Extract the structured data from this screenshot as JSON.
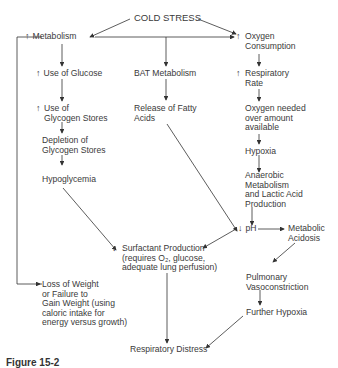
{
  "diagram": {
    "nodes": {
      "cold_stress": "COLD STRESS",
      "metabolism": "Metabolism",
      "oxygen_consumption": "Oxygen\nConsumption",
      "use_of_glucose": "Use of Glucose",
      "bat_metabolism": "BAT Metabolism",
      "respiratory_rate": "Respiratory\nRate",
      "use_of_glycogen": "Use of\nGlycogen Stores",
      "release_fatty_acids": "Release of Fatty\nAcids",
      "oxygen_needed": "Oxygen needed\nover amount\navailable",
      "depletion_glycogen": "Depletion of\nGlycogen Stores",
      "hypoxia": "Hypoxia",
      "hypoglycemia": "Hypoglycemia",
      "anaerobic": "Anaerobic\nMetabolism\nand Lactic Acid\nProduction",
      "ph": "pH",
      "metabolic_acidosis": "Metabolic\nAcidosis",
      "surfactant": "Surfactant Production\n(requires O₂, glucose,\nadequate lung perfusion)",
      "loss_of_weight": "Loss of Weight\nor Failure to\nGain Weight (using\ncaloric intake for\nenergy versus growth)",
      "pulmonary_vaso": "Pulmonary\nVasoconstriction",
      "further_hypoxia": "Further Hypoxia",
      "respiratory_distress": "Respiratory Distress"
    },
    "symbols": {
      "increase": "↑",
      "decrease": "↓"
    },
    "caption": "Figure 15-2"
  }
}
